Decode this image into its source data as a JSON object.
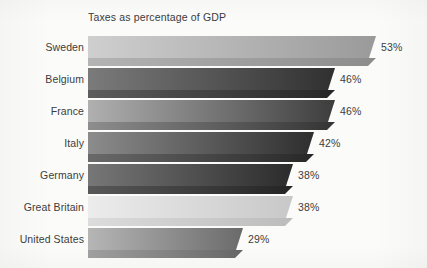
{
  "chart_data": {
    "type": "bar",
    "orientation": "horizontal",
    "title": "Taxes as percentage of GDP",
    "xlabel": "",
    "ylabel": "",
    "xlim": [
      0,
      57
    ],
    "grid": false,
    "legend": false,
    "value_suffix": "%",
    "categories": [
      "Sweden",
      "Belgium",
      "France",
      "Italy",
      "Germany",
      "Great Britain",
      "United States"
    ],
    "values": [
      53,
      46,
      46,
      42,
      38,
      38,
      29
    ],
    "value_labels": [
      "53%",
      "46%",
      "46%",
      "42%",
      "38%",
      "38%",
      "29%"
    ],
    "bars": [
      {
        "category": "Sweden",
        "value": 53,
        "value_label": "53%",
        "top_from": "#cfcfcf",
        "top_to": "#9a9a9a",
        "bottom_from": "#b4b4b4",
        "bottom_to": "#8c8c8c"
      },
      {
        "category": "Belgium",
        "value": 46,
        "value_label": "46%",
        "top_from": "#7b7b7b",
        "top_to": "#303030",
        "bottom_from": "#5d5d5d",
        "bottom_to": "#262626"
      },
      {
        "category": "France",
        "value": 46,
        "value_label": "46%",
        "top_from": "#b0b0b0",
        "top_to": "#3d3d3d",
        "bottom_from": "#8e8e8e",
        "bottom_to": "#333333"
      },
      {
        "category": "Italy",
        "value": 42,
        "value_label": "42%",
        "top_from": "#8c8c8c",
        "top_to": "#2e2e2e",
        "bottom_from": "#6a6a6a",
        "bottom_to": "#272727"
      },
      {
        "category": "Germany",
        "value": 38,
        "value_label": "38%",
        "top_from": "#777777",
        "top_to": "#2b2b2b",
        "bottom_from": "#585858",
        "bottom_to": "#242424"
      },
      {
        "category": "Great Britain",
        "value": 38,
        "value_label": "38%",
        "top_from": "#ececec",
        "top_to": "#c8c8c8",
        "bottom_from": "#dcdcdc",
        "bottom_to": "#bcbcbc"
      },
      {
        "category": "United States",
        "value": 29,
        "value_label": "29%",
        "top_from": "#b6b6b6",
        "top_to": "#6a6a6a",
        "bottom_from": "#a0a0a0",
        "bottom_to": "#656565"
      }
    ],
    "background_color": "#fbfbfa",
    "text_color": "#3c3c3c"
  },
  "layout": {
    "plot_left_px": 88,
    "rows": [
      {
        "top": 36,
        "height": 22,
        "width": 288,
        "label_top": 5,
        "value_left": 381,
        "value_top": 5
      },
      {
        "top": 68,
        "height": 22,
        "width": 247,
        "label_top": 5,
        "value_left": 340,
        "value_top": 5
      },
      {
        "top": 100,
        "height": 22,
        "width": 247,
        "label_top": 5,
        "value_left": 340,
        "value_top": 5
      },
      {
        "top": 132,
        "height": 22,
        "width": 226,
        "label_top": 5,
        "value_left": 319,
        "value_top": 5
      },
      {
        "top": 164,
        "height": 22,
        "width": 205,
        "label_top": 5,
        "value_left": 298,
        "value_top": 5
      },
      {
        "top": 196,
        "height": 22,
        "width": 205,
        "label_top": 5,
        "value_left": 298,
        "value_top": 5
      },
      {
        "top": 228,
        "height": 22,
        "width": 155,
        "label_top": 5,
        "value_left": 248,
        "value_top": 5
      }
    ]
  }
}
